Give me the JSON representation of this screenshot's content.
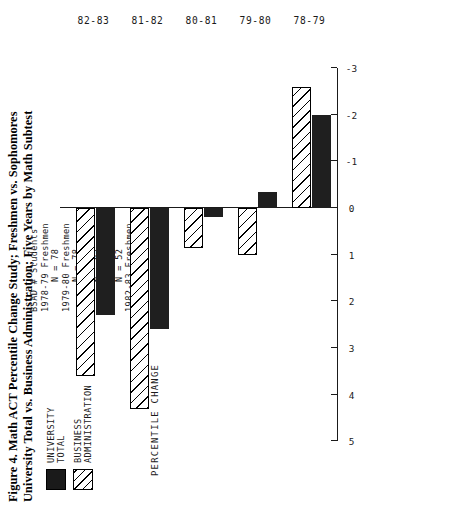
{
  "figure": {
    "title_line1": "Figure 4. Math ACT Percentile Change Study; Freshmen vs. Sophomores",
    "title_line2": "University Total vs. Business Administration; Five Years by Math Subtest"
  },
  "legend": {
    "items": [
      {
        "name": "university-total",
        "line1": "UNIVERSITY",
        "line2": "TOTAL",
        "pattern": "solid",
        "color": "#1f1f1f"
      },
      {
        "name": "business-administration",
        "line1": "BUSINESS",
        "line2": "ADMINISTRATION",
        "pattern": "hatch",
        "color": "#ffffff"
      }
    ]
  },
  "notes": {
    "heading": "BSAD # Students",
    "lines": [
      "1978-79 Freshmen",
      "N = 78",
      "1979-80 Freshmen",
      "N = 78",
      "1980-81 Freshmen",
      "N = 93",
      "1981-82 Freshmen",
      "N = 52",
      "1982-83 Freshmen",
      "N = 94"
    ]
  },
  "chart_data": {
    "type": "bar",
    "orientation": "horizontal-rotated",
    "title": "Figure 4. Math ACT Percentile Change Study; Freshmen vs. Sophomores University Total vs. Business Administration; Five Years by Math Subtest",
    "xlabel": "",
    "ylabel": "PERCENTILE CHANGE",
    "categories": [
      "78-79",
      "79-80",
      "80-81",
      "81-82",
      "82-83"
    ],
    "tick_labels": [
      "5",
      "4",
      "3",
      "2",
      "1",
      "0",
      "-1",
      "-2",
      "-3"
    ],
    "ticks": [
      5,
      4,
      3,
      2,
      1,
      0,
      -1,
      -2,
      -3
    ],
    "ylim": [
      -3,
      5
    ],
    "grid": false,
    "legend_position": "top-left",
    "series": [
      {
        "name": "UNIVERSITY TOTAL",
        "pattern": "solid",
        "values": [
          -2.0,
          -0.35,
          0.2,
          2.6,
          2.3
        ]
      },
      {
        "name": "BUSINESS ADMINISTRATION",
        "pattern": "hatch",
        "values": [
          -2.6,
          1.0,
          0.85,
          4.3,
          3.6
        ]
      }
    ]
  }
}
